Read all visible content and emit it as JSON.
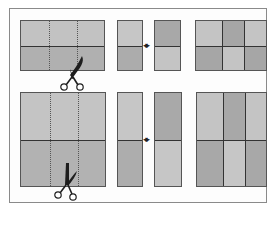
{
  "diagram": {
    "colors": {
      "light": "#c4c4c4",
      "mid": "#b3b3b3",
      "dark": "#a2a2a2",
      "line": "#333333",
      "frame": "#8a8a8a"
    },
    "rows": [
      {
        "name": "top-row",
        "source_shape": "wide rectangle",
        "dotted_cut_lines": 2,
        "pieces": [
          "light-top/dark-bottom strip",
          "dark-top/light-bottom strip"
        ],
        "swap_symbol": "↔",
        "result_grid": {
          "rows": 2,
          "cols": 3,
          "shades": [
            [
              "light",
              "dark",
              "light"
            ],
            [
              "dark",
              "light",
              "dark"
            ]
          ]
        }
      },
      {
        "name": "bottom-row",
        "source_shape": "square",
        "dotted_cut_lines": 2,
        "pieces": [
          "light-top/dark-bottom tall strip",
          "dark-top/light-bottom tall strip"
        ],
        "swap_symbol": "↔",
        "result_grid": {
          "rows": 2,
          "cols": 3,
          "shades": [
            [
              "light",
              "dark",
              "light"
            ],
            [
              "dark",
              "light",
              "dark"
            ]
          ]
        }
      }
    ],
    "icons": [
      "scissors-icon",
      "double-arrow-icon"
    ],
    "arrow_glyph": "◂▸"
  }
}
